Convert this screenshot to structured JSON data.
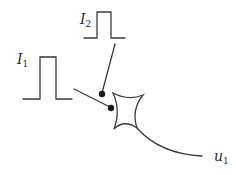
{
  "diagram": {
    "type": "neuron-with-two-pulse-inputs",
    "inputs": [
      {
        "id": "I1",
        "label_main": "I",
        "label_sub": "1",
        "signal": "rectangular-pulse"
      },
      {
        "id": "I2",
        "label_main": "I",
        "label_sub": "2",
        "signal": "rectangular-pulse"
      }
    ],
    "synapses": [
      {
        "from": "I1",
        "marker": "filled-dot"
      },
      {
        "from": "I2",
        "marker": "filled-dot"
      }
    ],
    "neuron": {
      "shape": "concave-four-pointed-cell-body"
    },
    "output": {
      "id": "u1",
      "label_main": "u",
      "label_sub": "1"
    },
    "colors": {
      "stroke": "#3a3a3a",
      "dot": "#1a1a1a",
      "background": "#ffffff"
    }
  }
}
